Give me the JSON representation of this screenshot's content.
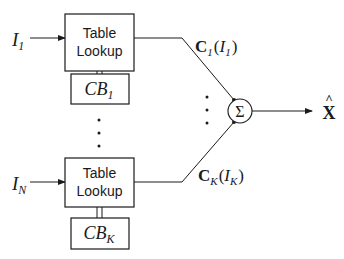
{
  "diagram": {
    "inputs": [
      {
        "symbol": "I",
        "subscript": "1"
      },
      {
        "symbol": "I",
        "subscript": "N"
      }
    ],
    "lookup_blocks": [
      {
        "line1": "Table",
        "line2": "Lookup"
      },
      {
        "line1": "Table",
        "line2": "Lookup"
      }
    ],
    "codebooks": [
      {
        "symbol": "CB",
        "subscript": "1"
      },
      {
        "symbol": "CB",
        "subscript": "K"
      }
    ],
    "branch_outputs": [
      {
        "vector": "C",
        "vec_sub": "1",
        "open": "(",
        "arg": "I",
        "arg_sub": "1",
        "close": ")"
      },
      {
        "vector": "C",
        "vec_sub": "K",
        "open": "(",
        "arg": "I",
        "arg_sub": "K",
        "close": ")"
      }
    ],
    "summer": {
      "symbol": "Σ"
    },
    "output": {
      "symbol": "X",
      "accent": "^"
    },
    "ellipsis": "⋮"
  }
}
